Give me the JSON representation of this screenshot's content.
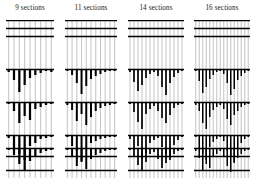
{
  "figure": {
    "type": "segmentation-dendrogram-grid",
    "background": "#ffffff",
    "ink": "#000000",
    "grid_line_color": "#c8c8c8",
    "panel_count": 4
  },
  "panels": [
    {
      "title": "9 sections",
      "n_sections": 9,
      "n_vertical_lines": 9,
      "x": 6,
      "width": 48,
      "rules_y": [
        0,
        8,
        16,
        49,
        82,
        115,
        128,
        136,
        150
      ],
      "combs": [
        {
          "base_y": 49,
          "bars": [
            3,
            11,
            23,
            16,
            9,
            6,
            4,
            2,
            3
          ]
        },
        {
          "base_y": 82,
          "bars": [
            2,
            9,
            21,
            14,
            18,
            7,
            5,
            3,
            2
          ]
        },
        {
          "base_y": 115,
          "bars": [
            3,
            13,
            19,
            25,
            11,
            8,
            4,
            3,
            2
          ]
        },
        {
          "base_y": 128,
          "bars": [
            2,
            7,
            16,
            22,
            13,
            9,
            5,
            3,
            2
          ]
        }
      ]
    },
    {
      "title": "11 sections",
      "n_sections": 11,
      "n_vertical_lines": 11,
      "x": 65,
      "width": 52,
      "rules_y": [
        0,
        8,
        16,
        49,
        82,
        115,
        128,
        136,
        150
      ],
      "combs": [
        {
          "base_y": 49,
          "bars": [
            2,
            6,
            14,
            25,
            17,
            10,
            7,
            5,
            3,
            2,
            2
          ]
        },
        {
          "base_y": 82,
          "bars": [
            3,
            8,
            19,
            12,
            23,
            15,
            9,
            6,
            4,
            3,
            2
          ]
        },
        {
          "base_y": 115,
          "bars": [
            2,
            11,
            16,
            27,
            14,
            8,
            6,
            4,
            3,
            2,
            2
          ]
        },
        {
          "base_y": 128,
          "bars": [
            2,
            9,
            18,
            13,
            21,
            11,
            7,
            5,
            3,
            2,
            2
          ]
        }
      ]
    },
    {
      "title": "14 sections",
      "n_sections": 14,
      "n_vertical_lines": 14,
      "x": 128,
      "width": 56,
      "rules_y": [
        0,
        8,
        16,
        49,
        82,
        115,
        128,
        136,
        150
      ],
      "combs": [
        {
          "base_y": 49,
          "bars": [
            3,
            13,
            22,
            16,
            9,
            5,
            3,
            7,
            18,
            26,
            14,
            8,
            4,
            2
          ]
        },
        {
          "base_y": 82,
          "bars": [
            2,
            10,
            20,
            27,
            12,
            7,
            4,
            9,
            16,
            21,
            13,
            6,
            3,
            2
          ]
        },
        {
          "base_y": 115,
          "bars": [
            4,
            15,
            11,
            24,
            18,
            8,
            5,
            3,
            12,
            19,
            25,
            10,
            5,
            2
          ]
        },
        {
          "base_y": 128,
          "bars": [
            2,
            8,
            17,
            23,
            14,
            6,
            4,
            11,
            20,
            15,
            9,
            6,
            3,
            2
          ]
        }
      ]
    },
    {
      "title": "16 sections",
      "n_sections": 16,
      "n_vertical_lines": 16,
      "x": 194,
      "width": 56,
      "rules_y": [
        0,
        8,
        16,
        49,
        82,
        115,
        128,
        136,
        150
      ],
      "combs": [
        {
          "base_y": 49,
          "bars": [
            2,
            12,
            24,
            18,
            10,
            6,
            3,
            2,
            5,
            14,
            26,
            20,
            11,
            7,
            4,
            2
          ]
        },
        {
          "base_y": 82,
          "bars": [
            3,
            9,
            21,
            27,
            15,
            8,
            5,
            3,
            7,
            17,
            23,
            13,
            9,
            5,
            3,
            2
          ]
        },
        {
          "base_y": 115,
          "bars": [
            2,
            14,
            19,
            25,
            12,
            7,
            4,
            2,
            6,
            16,
            22,
            28,
            13,
            8,
            4,
            2
          ]
        },
        {
          "base_y": 128,
          "bars": [
            3,
            10,
            22,
            16,
            20,
            9,
            6,
            3,
            8,
            18,
            24,
            14,
            10,
            6,
            3,
            2
          ]
        }
      ]
    }
  ]
}
